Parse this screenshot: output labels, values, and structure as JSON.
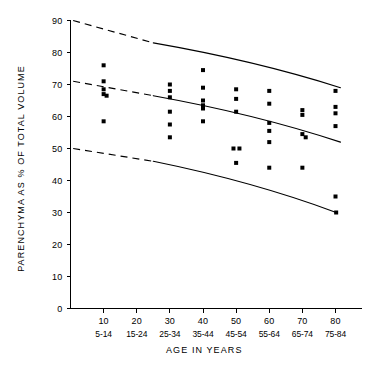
{
  "chart_data": {
    "type": "scatter",
    "title": "",
    "xlabel": "AGE IN YEARS",
    "ylabel": "PARENCHYMA AS % OF TOTAL VOLUME",
    "xlim": [
      0,
      88
    ],
    "ylim": [
      0,
      90
    ],
    "grid": false,
    "legend": "none",
    "x_ticks": [
      10,
      20,
      30,
      40,
      50,
      60,
      70,
      80
    ],
    "x_tick_labels": [
      "10",
      "20",
      "30",
      "40",
      "50",
      "60",
      "70",
      "80"
    ],
    "x_range_labels": [
      "5-14",
      "15-24",
      "25-34",
      "35-44",
      "45-54",
      "55-64",
      "65-74",
      "75-84"
    ],
    "y_ticks": [
      0,
      10,
      20,
      30,
      40,
      50,
      60,
      70,
      80,
      90
    ],
    "y_tick_labels": [
      "0",
      "10",
      "20",
      "30",
      "40",
      "50",
      "60",
      "70",
      "80",
      "90"
    ],
    "marker": "filled-square",
    "series": [
      {
        "name": "Parenchyma measurements",
        "points": [
          {
            "x": 10,
            "y": 76.0
          },
          {
            "x": 10,
            "y": 71.0
          },
          {
            "x": 10,
            "y": 68.5
          },
          {
            "x": 10,
            "y": 67.0
          },
          {
            "x": 10.9,
            "y": 66.5
          },
          {
            "x": 10,
            "y": 58.5
          },
          {
            "x": 30,
            "y": 70.0
          },
          {
            "x": 30,
            "y": 68.0
          },
          {
            "x": 30,
            "y": 66.0
          },
          {
            "x": 30,
            "y": 61.5
          },
          {
            "x": 30,
            "y": 57.5
          },
          {
            "x": 30,
            "y": 53.5
          },
          {
            "x": 40,
            "y": 74.5
          },
          {
            "x": 40,
            "y": 69.0
          },
          {
            "x": 40,
            "y": 65.0
          },
          {
            "x": 40,
            "y": 63.5
          },
          {
            "x": 40,
            "y": 62.5
          },
          {
            "x": 40,
            "y": 58.5
          },
          {
            "x": 50,
            "y": 68.5
          },
          {
            "x": 50,
            "y": 65.5
          },
          {
            "x": 50,
            "y": 61.5
          },
          {
            "x": 49.2,
            "y": 50.0
          },
          {
            "x": 51.0,
            "y": 50.0
          },
          {
            "x": 50,
            "y": 45.5
          },
          {
            "x": 60,
            "y": 68.0
          },
          {
            "x": 60,
            "y": 64.0
          },
          {
            "x": 60,
            "y": 58.0
          },
          {
            "x": 60,
            "y": 55.5
          },
          {
            "x": 60,
            "y": 52.0
          },
          {
            "x": 60,
            "y": 44.0
          },
          {
            "x": 70,
            "y": 62.0
          },
          {
            "x": 70,
            "y": 60.5
          },
          {
            "x": 70,
            "y": 54.5
          },
          {
            "x": 71.0,
            "y": 53.5
          },
          {
            "x": 70,
            "y": 44.0
          },
          {
            "x": 80,
            "y": 68.0
          },
          {
            "x": 80,
            "y": 63.0
          },
          {
            "x": 80,
            "y": 61.0
          },
          {
            "x": 80,
            "y": 57.0
          },
          {
            "x": 80,
            "y": 35.0
          },
          {
            "x": 80.2,
            "y": 30.0
          }
        ]
      }
    ],
    "reference_lines": [
      {
        "name": "upper-limit",
        "style": "dashed-then-solid",
        "dash_from": {
          "x": 0.8,
          "y": 90.0
        },
        "dash_to": {
          "x": 25.0,
          "y": 83.0
        },
        "solid_to": {
          "x": 81.5,
          "y": 69.0
        }
      },
      {
        "name": "mean-line",
        "style": "dashed-then-solid",
        "dash_from": {
          "x": 0.8,
          "y": 71.0
        },
        "dash_to": {
          "x": 25.0,
          "y": 66.5
        },
        "solid_to": {
          "x": 81.5,
          "y": 52.0
        }
      },
      {
        "name": "lower-limit",
        "style": "dashed-then-solid",
        "dash_from": {
          "x": 0.8,
          "y": 50.0
        },
        "dash_to": {
          "x": 25.0,
          "y": 46.0
        },
        "solid_to": {
          "x": 80.2,
          "y": 30.0
        }
      }
    ]
  }
}
